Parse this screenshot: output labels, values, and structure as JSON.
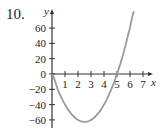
{
  "problem_number": "10.",
  "chart_data": {
    "type": "line",
    "title": "",
    "xlabel": "x",
    "ylabel": "y",
    "xlim": [
      0,
      7.5
    ],
    "ylim": [
      -72,
      75
    ],
    "x_ticks": [
      1,
      2,
      3,
      4,
      5,
      6,
      7
    ],
    "x_tick_labels": [
      "1",
      "2",
      "3",
      "4",
      "5",
      "6",
      "7"
    ],
    "y_ticks": [
      60,
      40,
      20,
      0,
      -20,
      -40,
      -60
    ],
    "y_tick_labels": [
      "60",
      "40",
      "20",
      "0",
      "−20",
      "−40",
      "−60"
    ],
    "grid": false,
    "series": [
      {
        "name": "f(x)",
        "color": "#9a9a9a",
        "x": [
          0,
          0.5,
          1,
          1.5,
          2,
          2.5,
          3,
          3.5,
          4,
          4.5,
          5,
          5.5,
          6,
          6.3
        ],
        "y": [
          0,
          -22.5,
          -40,
          -52.5,
          -60,
          -62.5,
          -60,
          -52.5,
          -40,
          -22.5,
          0,
          27.5,
          60,
          81.9
        ]
      }
    ]
  }
}
